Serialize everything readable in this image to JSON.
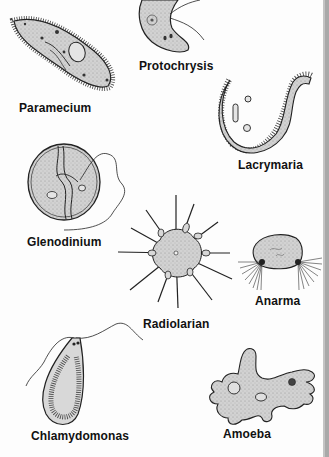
{
  "diagram": {
    "organisms": [
      {
        "id": "paramecium",
        "label": "Paramecium"
      },
      {
        "id": "protochrysis",
        "label": "Protochrysis"
      },
      {
        "id": "lacrymaria",
        "label": "Lacrymaria"
      },
      {
        "id": "glenodinium",
        "label": "Glenodinium"
      },
      {
        "id": "radiolarian",
        "label": "Radiolarian"
      },
      {
        "id": "anarma",
        "label": "Anarma"
      },
      {
        "id": "chlamydomonas",
        "label": "Chlamydomonas"
      },
      {
        "id": "amoeba",
        "label": "Amoeba"
      }
    ],
    "colors": {
      "body_fill": "#cfcfcf",
      "outline": "#222222",
      "label": "#111111",
      "edge_strip": "#a9a9a9"
    }
  }
}
